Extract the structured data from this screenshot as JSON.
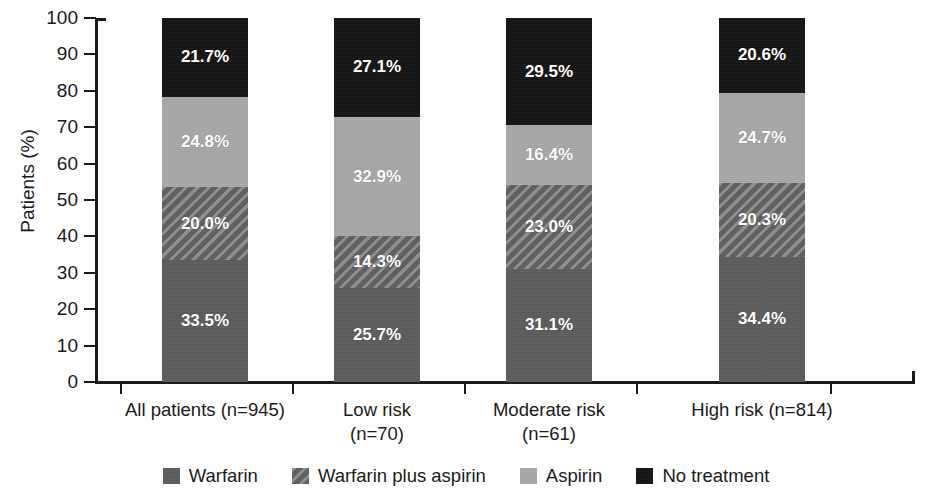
{
  "chart_data": {
    "type": "bar",
    "subtype": "stacked-bar-100",
    "title": "",
    "xlabel": "",
    "ylabel": "Patients (%)",
    "ylim": [
      0,
      100
    ],
    "ytick_labels": [
      "100",
      "90",
      "80",
      "70",
      "60",
      "50",
      "40",
      "30",
      "20",
      "10",
      "0"
    ],
    "yticks": [
      100,
      90,
      80,
      70,
      60,
      50,
      40,
      30,
      20,
      10,
      0
    ],
    "grid": false,
    "legend_position": "bottom",
    "categories": [
      "All patients (n=945)",
      "Low risk\n(n=70)",
      "Moderate risk\n(n=61)",
      "High risk (n=814)"
    ],
    "series": [
      {
        "name": "Warfarin",
        "color": "#5c5c5c",
        "values": [
          33.5,
          25.7,
          31.1,
          34.4
        ],
        "labels": [
          "33.5%",
          "25.7%",
          "31.1%",
          "34.4%"
        ]
      },
      {
        "name": "Warfarin plus aspirin",
        "color": "#6e6e6e",
        "values": [
          20.0,
          14.3,
          23.0,
          20.3
        ],
        "labels": [
          "20.0%",
          "14.3%",
          "23.0%",
          "20.3%"
        ]
      },
      {
        "name": "Aspirin",
        "color": "#a6a6a6",
        "values": [
          24.8,
          32.9,
          16.4,
          24.7
        ],
        "labels": [
          "24.8%",
          "32.9%",
          "16.4%",
          "24.7%"
        ]
      },
      {
        "name": "No treatment",
        "color": "#141414",
        "values": [
          21.7,
          27.1,
          29.5,
          20.6
        ],
        "labels": [
          "21.7%",
          "27.1%",
          "29.5%",
          "20.6%"
        ]
      }
    ]
  },
  "axis": {
    "y_title": "Patients (%)",
    "y_labels": [
      "100",
      "90",
      "80",
      "70",
      "60",
      "50",
      "40",
      "30",
      "20",
      "10",
      "0"
    ]
  },
  "x_categories": [
    {
      "line1": "All patients (n=945)",
      "line2": ""
    },
    {
      "line1": "Low risk",
      "line2": "(n=70)"
    },
    {
      "line1": "Moderate risk",
      "line2": "(n=61)"
    },
    {
      "line1": "High risk (n=814)",
      "line2": ""
    }
  ],
  "legend": {
    "items": [
      {
        "label": "Warfarin",
        "color": "#5c5c5c"
      },
      {
        "label": "Warfarin plus aspirin",
        "color": "#6e6e6e"
      },
      {
        "label": "Aspirin",
        "color": "#a6a6a6"
      },
      {
        "label": "No treatment",
        "color": "#141414"
      }
    ]
  },
  "bars": [
    {
      "category": "All patients (n=945)",
      "segments": [
        {
          "series": "No treatment",
          "value": 21.7,
          "label": "21.7%"
        },
        {
          "series": "Aspirin",
          "value": 24.8,
          "label": "24.8%"
        },
        {
          "series": "Warfarin plus aspirin",
          "value": 20.0,
          "label": "20.0%"
        },
        {
          "series": "Warfarin",
          "value": 33.5,
          "label": "33.5%"
        }
      ]
    },
    {
      "category": "Low risk (n=70)",
      "segments": [
        {
          "series": "No treatment",
          "value": 27.1,
          "label": "27.1%"
        },
        {
          "series": "Aspirin",
          "value": 32.9,
          "label": "32.9%"
        },
        {
          "series": "Warfarin plus aspirin",
          "value": 14.3,
          "label": "14.3%"
        },
        {
          "series": "Warfarin",
          "value": 25.7,
          "label": "25.7%"
        }
      ]
    },
    {
      "category": "Moderate risk (n=61)",
      "segments": [
        {
          "series": "No treatment",
          "value": 29.5,
          "label": "29.5%"
        },
        {
          "series": "Aspirin",
          "value": 16.4,
          "label": "16.4%"
        },
        {
          "series": "Warfarin plus aspirin",
          "value": 23.0,
          "label": "23.0%"
        },
        {
          "series": "Warfarin",
          "value": 31.1,
          "label": "31.1%"
        }
      ]
    },
    {
      "category": "High risk (n=814)",
      "segments": [
        {
          "series": "No treatment",
          "value": 20.6,
          "label": "20.6%"
        },
        {
          "series": "Aspirin",
          "value": 24.7,
          "label": "24.7%"
        },
        {
          "series": "Warfarin plus aspirin",
          "value": 20.3,
          "label": "20.3%"
        },
        {
          "series": "Warfarin",
          "value": 34.4,
          "label": "34.4%"
        }
      ]
    }
  ]
}
